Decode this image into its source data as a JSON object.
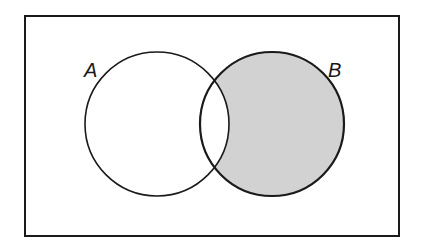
{
  "diagram": {
    "type": "venn",
    "universe": {
      "x": 25,
      "y": 16,
      "width": 374,
      "height": 220
    },
    "sets": [
      {
        "name": "A",
        "label": "A",
        "cx": 157,
        "cy": 124,
        "r": 72,
        "shaded": false
      },
      {
        "name": "B",
        "label": "B",
        "cx": 272,
        "cy": 124,
        "r": 72,
        "shaded": true
      }
    ],
    "shaded_region": "B \\ A",
    "colors": {
      "stroke": "#1a1a1a",
      "shade": "#d2d2d2",
      "background": "#ffffff"
    }
  }
}
